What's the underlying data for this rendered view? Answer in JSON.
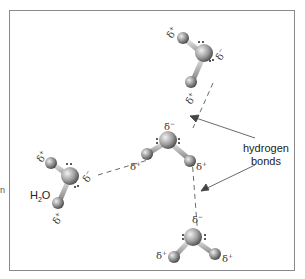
{
  "figure": {
    "molecule_label": "H2O",
    "molecule_label_main": "H",
    "molecule_label_sub": "2",
    "molecule_label_end": "O",
    "bond_label_line1": "hydrogen",
    "bond_label_line2": "bonds",
    "delta_minus": "δ",
    "delta_plus": "δ",
    "minus": "−",
    "plus": "+",
    "side_char": "n"
  },
  "molecules": [
    {
      "name": "top-right-water"
    },
    {
      "name": "left-water"
    },
    {
      "name": "center-water"
    },
    {
      "name": "bottom-water"
    }
  ]
}
